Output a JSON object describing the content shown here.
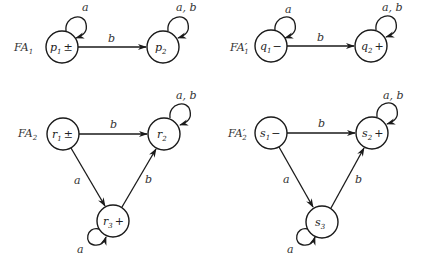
{
  "diagrams": [
    {
      "name": "FA1",
      "label": "FA",
      "label_sub": "1",
      "label_prime": "",
      "states": [
        {
          "id": "p1",
          "text": "p",
          "sub": "1",
          "mark": "±"
        },
        {
          "id": "p2",
          "text": "p",
          "sub": "2",
          "mark": ""
        }
      ],
      "edges": [
        {
          "from": "p1",
          "to": "p1",
          "label": "a"
        },
        {
          "from": "p1",
          "to": "p2",
          "label": "b"
        },
        {
          "from": "p2",
          "to": "p2",
          "label": "a, b"
        }
      ]
    },
    {
      "name": "FA1'",
      "label": "FA",
      "label_sub": "1",
      "label_prime": "′",
      "states": [
        {
          "id": "q1",
          "text": "q",
          "sub": "1",
          "mark": "−"
        },
        {
          "id": "q2",
          "text": "q",
          "sub": "2",
          "mark": "+"
        }
      ],
      "edges": [
        {
          "from": "q1",
          "to": "q1",
          "label": "a"
        },
        {
          "from": "q1",
          "to": "q2",
          "label": "b"
        },
        {
          "from": "q2",
          "to": "q2",
          "label": "a, b"
        }
      ]
    },
    {
      "name": "FA2",
      "label": "FA",
      "label_sub": "2",
      "label_prime": "",
      "states": [
        {
          "id": "r1",
          "text": "r",
          "sub": "1",
          "mark": "±"
        },
        {
          "id": "r2",
          "text": "r",
          "sub": "2",
          "mark": ""
        },
        {
          "id": "r3",
          "text": "r",
          "sub": "3",
          "mark": "+"
        }
      ],
      "edges": [
        {
          "from": "r1",
          "to": "r2",
          "label": "b"
        },
        {
          "from": "r1",
          "to": "r3",
          "label": "a"
        },
        {
          "from": "r3",
          "to": "r2",
          "label": "b"
        },
        {
          "from": "r3",
          "to": "r3",
          "label": "a"
        },
        {
          "from": "r2",
          "to": "r2",
          "label": "a, b"
        }
      ]
    },
    {
      "name": "FA2'",
      "label": "FA",
      "label_sub": "2",
      "label_prime": "′",
      "states": [
        {
          "id": "s1",
          "text": "s",
          "sub": "1",
          "mark": "−"
        },
        {
          "id": "s2",
          "text": "s",
          "sub": "2",
          "mark": "+"
        },
        {
          "id": "s3",
          "text": "s",
          "sub": "3",
          "mark": ""
        }
      ],
      "edges": [
        {
          "from": "s1",
          "to": "s2",
          "label": "b"
        },
        {
          "from": "s1",
          "to": "s3",
          "label": "a"
        },
        {
          "from": "s3",
          "to": "s2",
          "label": "b"
        },
        {
          "from": "s3",
          "to": "s3",
          "label": "a"
        },
        {
          "from": "s2",
          "to": "s2",
          "label": "a, b"
        }
      ]
    }
  ]
}
